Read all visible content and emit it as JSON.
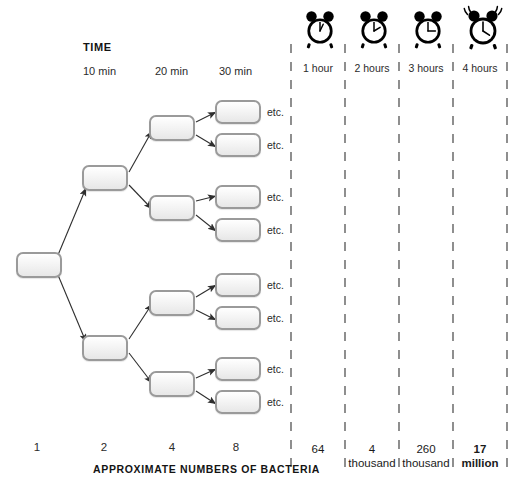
{
  "diagram": {
    "time_heading": "TIME",
    "time_ticks": [
      {
        "label": "10 min",
        "x": 83
      },
      {
        "label": "20 min",
        "x": 155
      },
      {
        "label": "30 min",
        "x": 219
      }
    ],
    "bottom_caption": "APPROXIMATE NUMBERS OF BACTERIA",
    "counts": [
      {
        "label": "1",
        "x": 37
      },
      {
        "label": "2",
        "x": 104
      },
      {
        "label": "4",
        "x": 172
      },
      {
        "label": "8",
        "x": 236
      }
    ],
    "etc_label": "etc.",
    "etc_rows": [
      110,
      143,
      195,
      228,
      283,
      316,
      367,
      400
    ]
  },
  "timeline": {
    "columns": [
      {
        "clock": "alarm-clock-icon",
        "label": "1 hour",
        "value": "64",
        "unit": "",
        "emphasis": false,
        "hands": "1-hour",
        "ringing": false
      },
      {
        "clock": "alarm-clock-icon",
        "label": "2 hours",
        "value": "4",
        "unit": "thousand",
        "emphasis": false,
        "hands": "2-hour",
        "ringing": false
      },
      {
        "clock": "alarm-clock-icon",
        "label": "3 hours",
        "value": "260",
        "unit": "thousand",
        "emphasis": false,
        "hands": "3-hour",
        "ringing": false
      },
      {
        "clock": "alarm-clock-icon",
        "label": "4 hours",
        "value": "17",
        "unit": "million",
        "emphasis": true,
        "hands": "4-hour",
        "ringing": true
      }
    ],
    "divider_x": [
      291,
      345,
      399,
      453,
      507
    ]
  },
  "colors": {
    "box_border": "#9a9a9a",
    "box_fill": "#f0f0f0",
    "arrow": "#333333",
    "divider": "#555555",
    "text": "#1a1a1a",
    "clock": "#000000"
  }
}
